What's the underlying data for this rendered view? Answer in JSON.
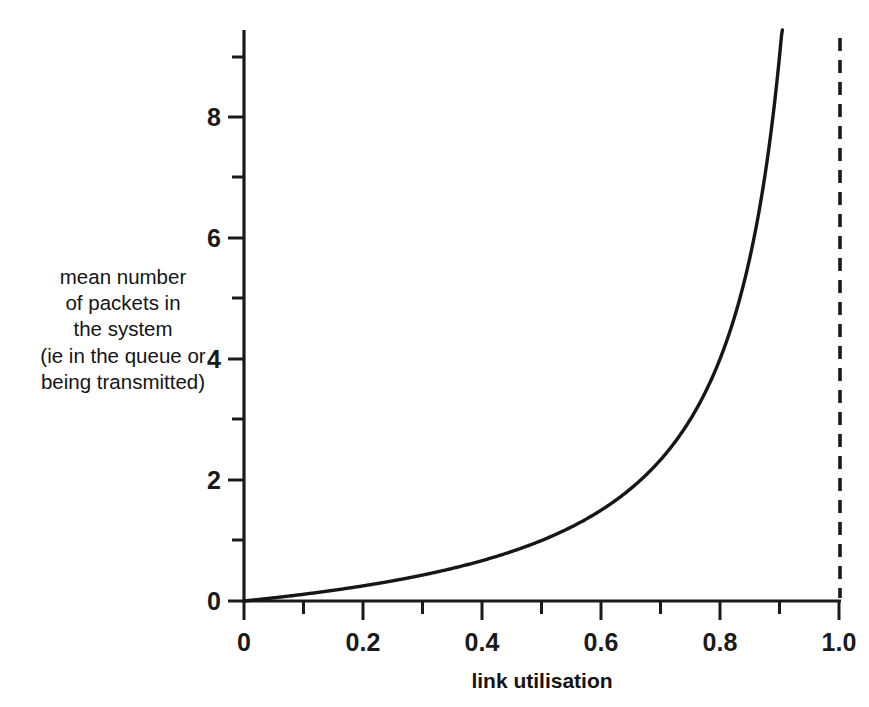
{
  "chart_data": {
    "type": "line",
    "title": "",
    "xlabel": "link utilisation",
    "ylabel": "mean number of packets in the system (ie in the queue or being transmitted)",
    "ylabel_lines": [
      "mean number",
      "of packets in",
      "the system",
      "(ie in the queue or",
      "being transmitted)"
    ],
    "xlim": [
      0,
      1.0
    ],
    "ylim": [
      0,
      9.4
    ],
    "grid": false,
    "legend": null,
    "x_ticks_major": [
      "0",
      "0.2",
      "0.4",
      "0.6",
      "0.8",
      "1.0"
    ],
    "x_tick_values_major": [
      0,
      0.2,
      0.4,
      0.6,
      0.8,
      1.0
    ],
    "x_tick_values_minor": [
      0.1,
      0.3,
      0.5,
      0.7,
      0.9
    ],
    "y_ticks_major": [
      "0",
      "2",
      "4",
      "6",
      "8"
    ],
    "y_tick_values_major": [
      0,
      2,
      4,
      6,
      8
    ],
    "y_tick_values_minor": [
      1,
      3,
      5,
      7,
      9
    ],
    "curve_color": "#161616",
    "asymptote_color": "#1a1a1a",
    "axis_color": "#1a1a1a",
    "background_color": "#ffffff",
    "annotations": [
      {
        "name": "asymptote",
        "type": "vertical-dashed-line",
        "x": 1.0,
        "label": ""
      }
    ],
    "series": [
      {
        "name": "mean number of packets in the system",
        "formula": "N = rho / (1 - rho)",
        "x": [
          0.0,
          0.05,
          0.1,
          0.15,
          0.2,
          0.25,
          0.3,
          0.35,
          0.4,
          0.45,
          0.5,
          0.55,
          0.6,
          0.65,
          0.7,
          0.75,
          0.8,
          0.82,
          0.84,
          0.86,
          0.88,
          0.89,
          0.9,
          0.905,
          0.91,
          0.914
        ],
        "values": [
          0.0,
          0.05,
          0.11,
          0.18,
          0.25,
          0.33,
          0.43,
          0.54,
          0.67,
          0.82,
          1.0,
          1.22,
          1.5,
          1.86,
          2.33,
          3.0,
          4.0,
          4.56,
          5.25,
          6.14,
          7.33,
          8.09,
          9.0,
          9.53,
          10.11,
          10.63
        ]
      }
    ]
  }
}
